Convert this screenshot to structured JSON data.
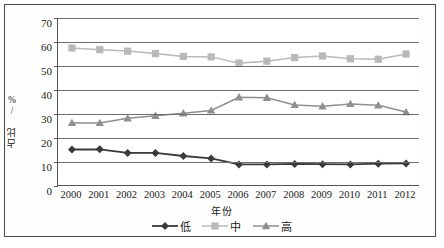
{
  "axes": {
    "ylabel": "占比 /%",
    "xlabel": "年份",
    "yticks": [
      "70",
      "60",
      "50",
      "40",
      "30",
      "20",
      "10",
      "0"
    ]
  },
  "legend": {
    "items": [
      {
        "label": "低",
        "marker": "diamond",
        "color": "#3a3a3a"
      },
      {
        "label": "中",
        "marker": "square",
        "color": "#b9b9b9"
      },
      {
        "label": "高",
        "marker": "triangle",
        "color": "#8f8f8f"
      }
    ]
  },
  "chart_data": {
    "type": "line",
    "title": "",
    "xlabel": "年份",
    "ylabel": "占比 /%",
    "ylim": [
      0,
      70
    ],
    "ytick_step": 10,
    "grid": true,
    "legend_position": "bottom",
    "categories": [
      "2000",
      "2001",
      "2002",
      "2003",
      "2004",
      "2005",
      "2006",
      "2007",
      "2008",
      "2009",
      "2010",
      "2011",
      "2012"
    ],
    "series": [
      {
        "name": "低",
        "marker": "diamond",
        "color": "#3a3a3a",
        "values": [
          15.2,
          15.3,
          13.8,
          13.8,
          12.5,
          11.5,
          9.0,
          9.0,
          9.2,
          9.1,
          9.0,
          9.3,
          9.4
        ]
      },
      {
        "name": "中",
        "marker": "square",
        "color": "#b9b9b9",
        "values": [
          57.5,
          56.8,
          56.2,
          55.2,
          54.0,
          53.8,
          51.2,
          52.0,
          53.5,
          54.2,
          53.0,
          52.8,
          55.0
        ]
      },
      {
        "name": "高",
        "marker": "triangle",
        "color": "#8f8f8f",
        "values": [
          26.3,
          26.3,
          28.2,
          29.3,
          30.3,
          31.5,
          37.0,
          36.8,
          33.8,
          33.2,
          34.2,
          33.6,
          30.8
        ]
      }
    ]
  }
}
